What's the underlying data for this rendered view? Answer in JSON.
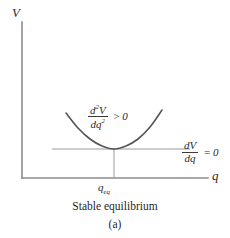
{
  "figure": {
    "caption_main": "Stable equilibrium",
    "caption_sub": "(a)",
    "axis_v_label": "V",
    "axis_q_label": "q",
    "equilibrium_label_base": "q",
    "equilibrium_label_sub": "eq",
    "second_derivative": {
      "numerator_d": "d",
      "numerator_exp": "2",
      "numerator_var": "V",
      "denominator_d": "d",
      "denominator_var": "q",
      "denominator_exp": "2",
      "relation": ">",
      "value": "0"
    },
    "first_derivative": {
      "numerator_d": "d",
      "numerator_var": "V",
      "denominator_d": "d",
      "denominator_var": "q",
      "relation": "=",
      "value": "0"
    }
  },
  "chart_data": {
    "type": "line",
    "title": "Stable equilibrium",
    "subtitle": "(a)",
    "xlabel": "q",
    "ylabel": "V",
    "grid": false,
    "legend": null,
    "axis_style": "open-corner-L-axes-no-ticks",
    "series": [
      {
        "name": "potential-energy-curve",
        "shape": "upward-parabola",
        "color": "#555555",
        "vertex": {
          "x": 114,
          "y": 149
        },
        "points_px": [
          {
            "x": 66,
            "y": 113
          },
          {
            "x": 78,
            "y": 128
          },
          {
            "x": 90,
            "y": 139
          },
          {
            "x": 102,
            "y": 146
          },
          {
            "x": 114,
            "y": 149
          },
          {
            "x": 126,
            "y": 146
          },
          {
            "x": 138,
            "y": 139
          },
          {
            "x": 150,
            "y": 127
          },
          {
            "x": 162,
            "y": 110
          }
        ]
      }
    ],
    "annotations": [
      {
        "name": "tangent-line",
        "type": "horizontal-line",
        "text": "dV/dq = 0",
        "y_px": 149,
        "x_start_px": 52,
        "x_end_px": 190,
        "color": "#9a9a9a"
      },
      {
        "name": "equilibrium-drop-line",
        "type": "vertical-line",
        "text": "q_eq",
        "x_px": 114,
        "y_start_px": 149,
        "y_end_px": 178,
        "color": "#9a9a9a"
      },
      {
        "name": "concavity-label",
        "type": "text",
        "text": "d²V/dq² > 0",
        "x_px": 88,
        "y_px": 103
      }
    ],
    "axes_px": {
      "origin": {
        "x": 22,
        "y": 178
      },
      "y_axis_top": {
        "x": 22,
        "y": 22
      },
      "x_axis_right": {
        "x": 208,
        "y": 178
      }
    },
    "colors": {
      "curve": "#555555",
      "axes": "#8c8c8c",
      "guides": "#9a9a9a",
      "text": "#1f1f1f",
      "background": "#ffffff"
    }
  }
}
